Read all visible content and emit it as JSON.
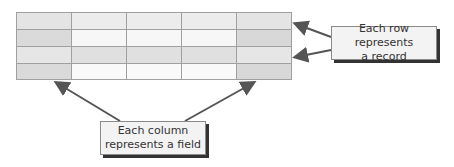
{
  "diagram": {
    "table": {
      "rows": 4,
      "columns": 5,
      "cell_colors": [
        [
          "#e4e4e4",
          "#ececec",
          "#ececec",
          "#ececec",
          "#e4e4e4"
        ],
        [
          "#dadada",
          "#f7f7f7",
          "#f7f7f7",
          "#f7f7f7",
          "#d8d8d8"
        ],
        [
          "#e6e6e6",
          "#e0e0e0",
          "#e0e0e0",
          "#e0e0e0",
          "#e6e6e6"
        ],
        [
          "#dadada",
          "#f9f9f9",
          "#f9f9f9",
          "#f9f9f9",
          "#d8d8d8"
        ]
      ]
    },
    "row_callout": {
      "line1": "Each row represents",
      "line2": "a record"
    },
    "column_callout": {
      "line1": "Each column",
      "line2": "represents a field"
    },
    "colors": {
      "border": "#9a9a9a",
      "arrow": "#555555",
      "callout_bg": "#f3f3f3",
      "shadow": "#333333"
    }
  }
}
